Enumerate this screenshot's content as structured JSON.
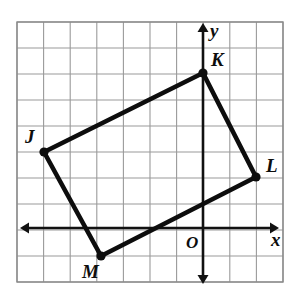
{
  "figure": {
    "type": "geometry-diagram",
    "background_color": "#ffffff",
    "ink_color": "#0d0d0d",
    "grid_color": "#9a9a9a"
  },
  "grid": {
    "columns": 10,
    "rows": 10,
    "cell_size_px": 26.6,
    "left_px": 17,
    "top_px": 22,
    "right_px": 283,
    "bottom_px": 282,
    "show_border": true,
    "vertical_lines_px": [
      17,
      43.6,
      70.2,
      96.8,
      123.4,
      150,
      176.6,
      203.2,
      229.8,
      256.4,
      283
    ],
    "horizontal_lines_px": [
      22,
      48,
      74,
      100,
      126,
      152,
      178,
      204,
      230,
      256,
      282
    ]
  },
  "axes": {
    "x_axis": {
      "label": "x",
      "label_x_px": 271,
      "label_y_px": 246,
      "y_px": 228,
      "start_x_px": 20,
      "end_x_px": 279,
      "double_arrow": true
    },
    "y_axis": {
      "label": "y",
      "label_x_px": 210,
      "label_y_px": 37,
      "x_px": 203,
      "start_y_px": 23,
      "end_y_px": 284,
      "double_arrow": true
    },
    "origin": {
      "label": "O",
      "x_px": 203,
      "y_px": 228,
      "label_x_px": 186,
      "label_y_px": 248
    }
  },
  "shape": {
    "name": "JKLM",
    "closed": true,
    "stroke_width_px": 4.6,
    "vertices": [
      {
        "label": "J",
        "x_px": 44,
        "y_px": 152,
        "grid_x": -6,
        "grid_y": 3,
        "label_x_px": 25,
        "label_y_px": 143
      },
      {
        "label": "K",
        "x_px": 203,
        "y_px": 73,
        "grid_x": 0,
        "grid_y": 6,
        "label_x_px": 211,
        "label_y_px": 66
      },
      {
        "label": "L",
        "x_px": 256,
        "y_px": 177,
        "grid_x": 2,
        "grid_y": 2,
        "label_x_px": 266,
        "label_y_px": 172
      },
      {
        "label": "M",
        "x_px": 101,
        "y_px": 256,
        "grid_x": -4,
        "grid_y": -1,
        "label_x_px": 82,
        "label_y_px": 278
      }
    ],
    "edges": [
      {
        "from": "J",
        "to": "K"
      },
      {
        "from": "K",
        "to": "L"
      },
      {
        "from": "L",
        "to": "M"
      },
      {
        "from": "M",
        "to": "J"
      }
    ]
  }
}
